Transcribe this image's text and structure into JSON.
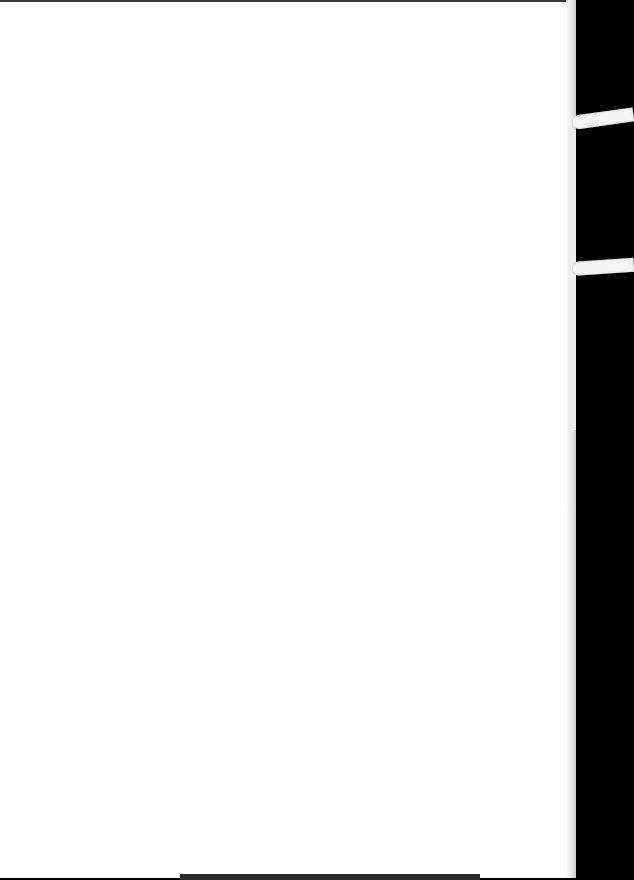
{
  "document": {
    "type": "scanned-blank-page",
    "visible_text": {
      "top_showthrough": "",
      "center_showthrough": ""
    },
    "colors": {
      "page": "#ffffff",
      "background": "#000000"
    }
  }
}
